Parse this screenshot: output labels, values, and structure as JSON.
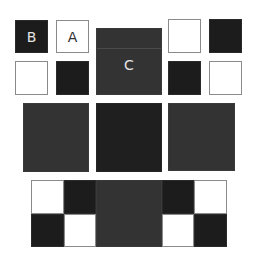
{
  "diagram": {
    "labels": {
      "b": "B",
      "a": "A",
      "c": "C"
    },
    "colors": {
      "white": "#ffffff",
      "black": "#1c1c1c",
      "gray": "#333333",
      "dark": "#1f1f1f",
      "border_light": "#8a8a8a"
    },
    "top_left_group": [
      {
        "pos": "top-left",
        "fill": "black",
        "label": "B"
      },
      {
        "pos": "top-right",
        "fill": "white",
        "label": "A"
      },
      {
        "pos": "bottom-left",
        "fill": "white",
        "label": ""
      },
      {
        "pos": "bottom-right",
        "fill": "black",
        "label": ""
      }
    ],
    "center_square": {
      "fill": "gray",
      "label": "C"
    },
    "top_right_group": [
      {
        "pos": "top-left",
        "fill": "white"
      },
      {
        "pos": "top-right",
        "fill": "black"
      },
      {
        "pos": "bottom-left",
        "fill": "black"
      },
      {
        "pos": "bottom-right",
        "fill": "white"
      }
    ],
    "middle_row": [
      {
        "fill": "gray"
      },
      {
        "fill": "dark"
      },
      {
        "fill": "gray"
      }
    ],
    "bottom_strip": {
      "left_checker": [
        "white",
        "black",
        "black",
        "white"
      ],
      "center": "gray",
      "right_checker": [
        "black",
        "white",
        "white",
        "black"
      ]
    }
  }
}
